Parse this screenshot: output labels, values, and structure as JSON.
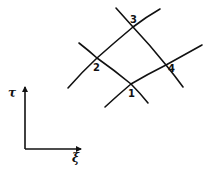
{
  "diagram": {
    "title": "",
    "stroke_color": "#111111",
    "background": "#ffffff",
    "grid_lines": [
      {
        "id": "xi-line-lower",
        "desc": "curve through nodes 1 and 4",
        "points": [
          [
            105,
            107
          ],
          [
            131,
            84
          ],
          [
            166,
            65
          ],
          [
            202,
            45
          ]
        ]
      },
      {
        "id": "xi-line-upper",
        "desc": "curve through nodes 2 and 3",
        "points": [
          [
            68,
            88
          ],
          [
            97,
            58
          ],
          [
            133,
            27
          ],
          [
            160,
            9
          ]
        ]
      },
      {
        "id": "tau-line-left",
        "desc": "curve through nodes 2 and 1",
        "points": [
          [
            79,
            43
          ],
          [
            97,
            58
          ],
          [
            131,
            84
          ],
          [
            148,
            103
          ]
        ]
      },
      {
        "id": "tau-line-right",
        "desc": "curve through nodes 3 and 4",
        "points": [
          [
            116,
            8
          ],
          [
            133,
            27
          ],
          [
            166,
            65
          ],
          [
            183,
            87
          ]
        ]
      }
    ],
    "nodes": [
      {
        "label": "1",
        "x": 131,
        "y": 84,
        "label_x": 128,
        "label_y": 97
      },
      {
        "label": "2",
        "x": 97,
        "y": 58,
        "label_x": 94,
        "label_y": 71
      },
      {
        "label": "3",
        "x": 133,
        "y": 27,
        "label_x": 130,
        "label_y": 22
      },
      {
        "label": "4",
        "x": 166,
        "y": 65,
        "label_x": 169,
        "label_y": 73
      }
    ],
    "axes": {
      "origin": [
        25,
        149
      ],
      "vertical": {
        "label": "τ",
        "end": [
          25,
          86
        ]
      },
      "horizontal": {
        "label": "ξ",
        "end": [
          82,
          149
        ]
      }
    }
  }
}
